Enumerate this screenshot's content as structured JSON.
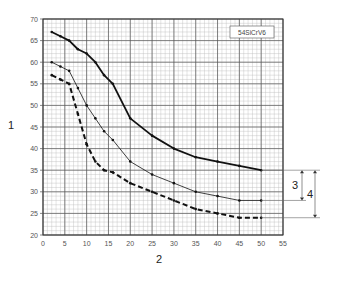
{
  "chart_data": {
    "type": "line",
    "title": "",
    "xlabel": "2",
    "ylabel": "1",
    "xlim": [
      0,
      55
    ],
    "ylim": [
      20,
      70
    ],
    "x_ticks": [
      0,
      5,
      10,
      15,
      20,
      25,
      30,
      35,
      40,
      45,
      50,
      55
    ],
    "y_ticks": [
      20,
      25,
      30,
      35,
      40,
      45,
      50,
      55,
      60,
      65,
      70
    ],
    "grid": true,
    "legend_box": "54SiCrV6",
    "series": [
      {
        "name": "upper (thick solid)",
        "style": "thick-solid",
        "x": [
          2,
          4,
          6,
          8,
          10,
          12,
          14,
          16,
          20,
          25,
          30,
          35,
          40,
          45,
          50
        ],
        "values": [
          67,
          66,
          65,
          63,
          62,
          60,
          57,
          55,
          47,
          43,
          40,
          38,
          37,
          36,
          35
        ]
      },
      {
        "name": "middle (thin solid)",
        "style": "thin-solid",
        "x": [
          2,
          4,
          6,
          8,
          10,
          12,
          14,
          16,
          20,
          25,
          30,
          35,
          40,
          45,
          50
        ],
        "values": [
          60,
          59,
          58,
          54,
          50,
          47,
          44,
          42,
          37,
          34,
          32,
          30,
          29,
          28,
          28
        ]
      },
      {
        "name": "lower (thick dashed)",
        "style": "thick-dashed",
        "x": [
          2,
          4,
          6,
          8,
          10,
          12,
          14,
          16,
          20,
          25,
          30,
          35,
          40,
          45,
          50
        ],
        "values": [
          57,
          56,
          55,
          48,
          41,
          37,
          35,
          34.5,
          32,
          30,
          28,
          26,
          25,
          24,
          24
        ]
      }
    ],
    "annotations": [
      {
        "label": "3",
        "from_series": "upper",
        "to_series": "middle",
        "at_x": 50
      },
      {
        "label": "4",
        "from_series": "upper",
        "to_series": "lower",
        "at_x": 50
      }
    ]
  }
}
